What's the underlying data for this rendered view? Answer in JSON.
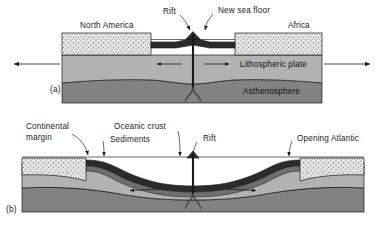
{
  "figure": {
    "type": "geological cross-section",
    "panel_count": 2,
    "colors": {
      "background": "#ffffff",
      "continental_crust": "#e9e9e9",
      "stipple_dot": "#5a5a5a",
      "lithosphere": "#b2b2b2",
      "asthenosphere": "#828282",
      "oceanic_crust": "#2b2b2b",
      "sediment_band": "#6e6e6e",
      "outline": "#1a1a1a",
      "text": "#1a1a1a"
    }
  },
  "panel_a": {
    "key": "(a)",
    "caption": "Early rifting stage: a continental landmass splits and new sea floor forms at the rift.",
    "labels": {
      "north_america": "North America",
      "africa": "Africa",
      "rift": "Rift",
      "new_sea_floor": "New sea floor",
      "lithospheric_plate": "Lithospheric plate",
      "asthenosphere": "Asthenosphere"
    },
    "layers": [
      {
        "name": "continental crust",
        "fill": "stippled",
        "label": "North America / Africa"
      },
      {
        "name": "lithospheric plate",
        "fill": "mid-gray",
        "label": "Lithospheric plate"
      },
      {
        "name": "asthenosphere",
        "fill": "dark-gray",
        "label": "Asthenosphere"
      }
    ],
    "arrows": {
      "outer_left": "left",
      "outer_right": "right",
      "inner_left": "left",
      "inner_right": "right",
      "count": 4,
      "meaning": "plate divergence away from the rift"
    },
    "features": {
      "rift_conduit": "vertical magma conduit from asthenosphere to rift",
      "convection_plume": "divergent upwelling plume beneath the rift",
      "volcanic_peak": "dark ridge crest at the rift axis"
    }
  },
  "panel_b": {
    "key": "(b)",
    "caption": "Mature stage: passive continental margins flank a widening ocean basin with new oceanic crust.",
    "labels": {
      "continental_margin_line1": "Continental",
      "continental_margin_line2": "margin",
      "oceanic_crust": "Oceanic crust",
      "sediments": "Sediments",
      "rift": "Rift",
      "opening_atlantic": "Opening Atlantic"
    },
    "layers": [
      {
        "name": "continental margin",
        "fill": "stippled",
        "label": "Continental margin"
      },
      {
        "name": "sediments",
        "fill": "gray band",
        "label": "Sediments"
      },
      {
        "name": "oceanic crust",
        "fill": "dark band",
        "label": "Oceanic crust"
      },
      {
        "name": "lithospheric plate",
        "fill": "mid-gray",
        "label": ""
      },
      {
        "name": "asthenosphere",
        "fill": "dark-gray",
        "label": ""
      }
    ],
    "arrows": {
      "inner_left": "left",
      "inner_right": "right",
      "count": 2,
      "meaning": "sea-floor spreading away from the rift axis"
    },
    "features": {
      "rift_conduit": "vertical magma conduit at the ridge axis",
      "convection_plume": "divergent upwelling plume beneath the ridge",
      "sea_level": "horizontal sea-surface line across the basin"
    }
  }
}
